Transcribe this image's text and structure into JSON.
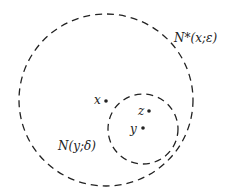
{
  "diagram": {
    "labels": {
      "big_neighborhood": "N*(x;ε)",
      "small_neighborhood": "N(y;δ)",
      "point_x": "x",
      "point_y": "y",
      "point_z": "z"
    },
    "colors": {
      "stroke": "#222222",
      "background": "#ffffff"
    }
  }
}
